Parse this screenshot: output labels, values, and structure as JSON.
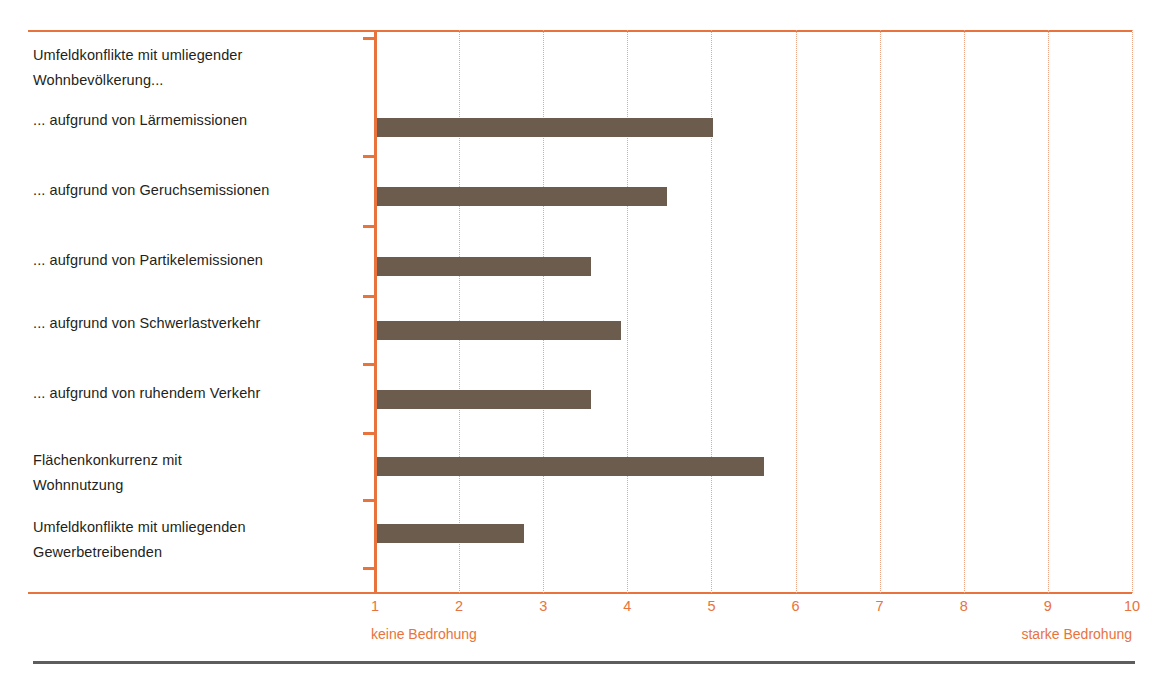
{
  "figure": {
    "clipped_title_fragment": "",
    "bar_color": "#6b5c4e",
    "axis_color": "#e8733c",
    "grid_color": "#f0a385",
    "label_color": "#231f20",
    "rule_color": "#5d5d5d"
  },
  "chart_data": {
    "type": "bar",
    "orientation": "horizontal",
    "title": "",
    "xlabel": "",
    "ylabel": "",
    "xlim": [
      1,
      10
    ],
    "grid": true,
    "legend": false,
    "xticks": [
      "1",
      "2",
      "3",
      "4",
      "5",
      "6",
      "7",
      "8",
      "9",
      "10"
    ],
    "xtick_values": [
      1,
      2,
      3,
      4,
      5,
      6,
      7,
      8,
      9,
      10
    ],
    "scale_anchor_low": "keine Bedrohung",
    "scale_anchor_high": "starke Bedrohung",
    "group_headers": [
      {
        "text": "Umfeldkonflikte mit umliegender Wohnbevölkerung...",
        "lines": [
          "Umfeldkonflikte mit umliegender",
          "Wohnbevölkerung..."
        ]
      }
    ],
    "categories": [
      "... aufgrund von Lärmemissionen",
      "... aufgrund von Geruchsemissionen",
      "... aufgrund von Partikelemissionen",
      "... aufgrund von Schwerlastverkehr",
      "... aufgrund von ruhendem Verkehr",
      "Flächenkonkurrenz mit Wohnnutzung",
      "Umfeldkonflikte mit umliegenden Gewerbetreibenden"
    ],
    "category_lines": [
      [
        "... aufgrund von Lärmemissionen"
      ],
      [
        "... aufgrund von Geruchsemissionen"
      ],
      [
        "... aufgrund von Partikelemissionen"
      ],
      [
        "... aufgrund von Schwerlastverkehr"
      ],
      [
        "... aufgrund von ruhendem Verkehr"
      ],
      [
        "Flächenkonkurrenz mit",
        "Wohnnutzung"
      ],
      [
        "Umfeldkonflikte mit umliegenden",
        "Gewerbetreibenden"
      ]
    ],
    "values": [
      5.0,
      4.45,
      3.55,
      3.9,
      3.55,
      5.6,
      2.75
    ]
  }
}
